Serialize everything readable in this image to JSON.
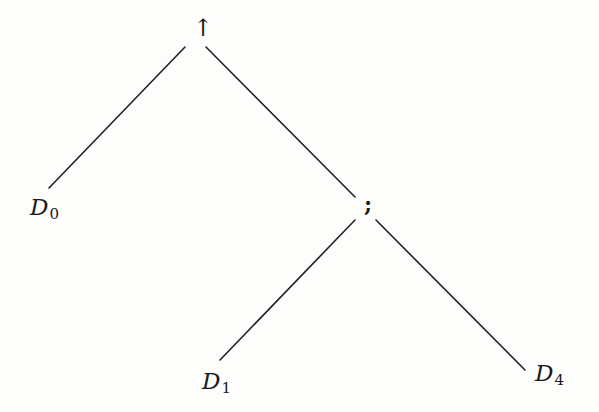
{
  "diagram": {
    "type": "tree",
    "nodes": [
      {
        "id": "root",
        "label": "↑",
        "role": "operator"
      },
      {
        "id": "d0",
        "label": "D",
        "subscript": "0",
        "role": "leaf"
      },
      {
        "id": "seq",
        "label": ";",
        "role": "operator"
      },
      {
        "id": "d1",
        "label": "D",
        "subscript": "1",
        "role": "leaf"
      },
      {
        "id": "d4",
        "label": "D",
        "subscript": "4",
        "role": "leaf"
      }
    ],
    "edges": [
      {
        "from": "root",
        "to": "d0"
      },
      {
        "from": "root",
        "to": "seq"
      },
      {
        "from": "seq",
        "to": "d1"
      },
      {
        "from": "seq",
        "to": "d4"
      }
    ],
    "colors": {
      "line": "#222222",
      "text": "#1a1a1a",
      "background": "#fdfdfb"
    }
  }
}
